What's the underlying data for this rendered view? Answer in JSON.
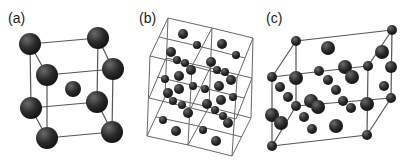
{
  "figure": {
    "panels": [
      {
        "id": "a",
        "label": "(a)",
        "description": "body-centered cubic unit cell"
      },
      {
        "id": "b",
        "label": "(b)",
        "description": "2x2x2 supercell lattice with interstitial atoms"
      },
      {
        "id": "c",
        "label": "(c)",
        "description": "elongated cell with corner and interior atoms"
      }
    ],
    "colors": {
      "atom_dark": "#1e1e1e",
      "atom_highlight": "#6a6a6a",
      "frame_line": "#555555",
      "background": "#ffffff"
    }
  }
}
